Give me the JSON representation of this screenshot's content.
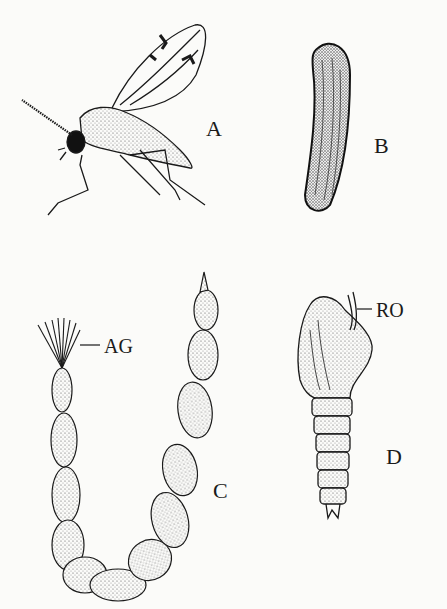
{
  "figure": {
    "panels": [
      {
        "id": "A",
        "label": "A",
        "subject": "adult midge (fly) with wings"
      },
      {
        "id": "B",
        "label": "B",
        "subject": "egg"
      },
      {
        "id": "C",
        "label": "C",
        "subject": "larva"
      },
      {
        "id": "D",
        "label": "D",
        "subject": "pupa"
      }
    ],
    "annotations": [
      {
        "id": "AG",
        "label": "AG",
        "panel": "C"
      },
      {
        "id": "RO",
        "label": "RO",
        "panel": "D"
      }
    ],
    "colors": {
      "ink": "#1a1a1a",
      "paper": "#fbfbf9",
      "stipple": "#d8d8d4"
    }
  }
}
